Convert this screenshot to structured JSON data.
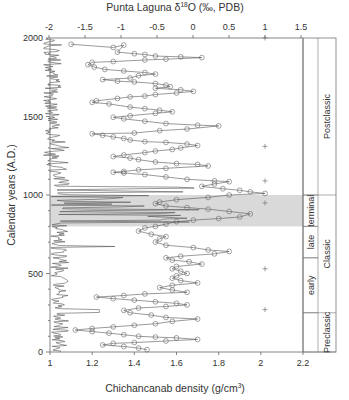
{
  "chart_data": {
    "type": "line",
    "title": "",
    "top_axis": {
      "label": "Punta Laguna δ18O (‰, PDB)",
      "label_main": "Punta Laguna δ",
      "label_sup": "18",
      "label_rest": "O (‰, PDB)",
      "range": [
        -2,
        1.5
      ],
      "ticks": [
        -2,
        -1.5,
        -1,
        -0.5,
        0,
        0.5,
        1,
        1.5
      ]
    },
    "bottom_axis": {
      "label": "Chichancanab density (g/cm3)",
      "label_main": "Chichancanab density (g/cm",
      "label_sup": "3",
      "label_rest": ")",
      "range": [
        1,
        2.2
      ],
      "ticks": [
        1,
        1.2,
        1.4,
        1.6,
        1.8,
        2,
        2.2
      ]
    },
    "ylabel": "Calendar years (A.D.)",
    "ylim": [
      0,
      2000
    ],
    "yticks": [
      0,
      500,
      1000,
      1500,
      2000
    ],
    "shaded_band": {
      "from": 800,
      "to": 1000,
      "color": "#d9d9d9"
    },
    "periods": {
      "sub": [
        {
          "label": "terminal",
          "from": 800,
          "to": 1000
        },
        {
          "label": "late",
          "from": 600,
          "to": 800
        },
        {
          "label": "early",
          "from": 250,
          "to": 600
        }
      ],
      "major": [
        {
          "label": "Postclassic",
          "from": 1000,
          "to": 2000
        },
        {
          "label": "Classic",
          "from": 250,
          "to": 1000
        },
        {
          "label": "Preclassic",
          "from": 0,
          "to": 250
        }
      ]
    },
    "series": [
      {
        "name": "Chichancanab density",
        "axis": "bottom",
        "line_color": "#444444",
        "points": [
          [
            1.1,
            1960
          ],
          [
            1.3,
            1940
          ],
          [
            1.35,
            1955
          ],
          [
            1.32,
            1910
          ],
          [
            1.4,
            1900
          ],
          [
            1.45,
            1895
          ],
          [
            1.5,
            1885
          ],
          [
            1.62,
            1880
          ],
          [
            1.72,
            1875
          ],
          [
            1.55,
            1865
          ],
          [
            1.45,
            1860
          ],
          [
            1.3,
            1850
          ],
          [
            1.2,
            1845
          ],
          [
            1.18,
            1830
          ],
          [
            1.21,
            1815
          ],
          [
            1.26,
            1800
          ],
          [
            1.35,
            1790
          ],
          [
            1.45,
            1780
          ],
          [
            1.5,
            1770
          ],
          [
            1.42,
            1760
          ],
          [
            1.38,
            1745
          ],
          [
            1.25,
            1735
          ],
          [
            1.32,
            1725
          ],
          [
            1.4,
            1720
          ],
          [
            1.5,
            1710
          ],
          [
            1.55,
            1700
          ],
          [
            1.57,
            1690
          ],
          [
            1.5,
            1680
          ],
          [
            1.62,
            1670
          ],
          [
            1.68,
            1660
          ],
          [
            1.6,
            1650
          ],
          [
            1.5,
            1640
          ],
          [
            1.45,
            1630
          ],
          [
            1.38,
            1625
          ],
          [
            1.32,
            1615
          ],
          [
            1.22,
            1600
          ],
          [
            1.2,
            1590
          ],
          [
            1.28,
            1580
          ],
          [
            1.38,
            1560
          ],
          [
            1.45,
            1550
          ],
          [
            1.52,
            1540
          ],
          [
            1.58,
            1530
          ],
          [
            1.5,
            1520
          ],
          [
            1.38,
            1505
          ],
          [
            1.3,
            1495
          ],
          [
            1.35,
            1485
          ],
          [
            1.45,
            1470
          ],
          [
            1.55,
            1455
          ],
          [
            1.7,
            1445
          ],
          [
            1.8,
            1440
          ],
          [
            1.65,
            1420
          ],
          [
            1.52,
            1410
          ],
          [
            1.4,
            1395
          ],
          [
            1.2,
            1390
          ],
          [
            1.25,
            1380
          ],
          [
            1.3,
            1370
          ],
          [
            1.35,
            1360
          ],
          [
            1.38,
            1350
          ],
          [
            1.45,
            1340
          ],
          [
            1.55,
            1335
          ],
          [
            1.65,
            1325
          ],
          [
            1.7,
            1315
          ],
          [
            1.62,
            1300
          ],
          [
            1.58,
            1290
          ],
          [
            1.5,
            1280
          ],
          [
            1.45,
            1270
          ],
          [
            1.35,
            1255
          ],
          [
            1.3,
            1245
          ],
          [
            1.38,
            1235
          ],
          [
            1.42,
            1225
          ],
          [
            1.5,
            1210
          ],
          [
            1.6,
            1200
          ],
          [
            1.7,
            1195
          ],
          [
            1.75,
            1185
          ],
          [
            1.55,
            1170
          ],
          [
            1.42,
            1160
          ],
          [
            1.35,
            1150
          ],
          [
            1.3,
            1145
          ],
          [
            1.35,
            1140
          ],
          [
            1.45,
            1130
          ],
          [
            1.55,
            1115
          ],
          [
            1.65,
            1100
          ],
          [
            1.78,
            1090
          ],
          [
            1.85,
            1085
          ],
          [
            1.78,
            1070
          ],
          [
            1.72,
            1055
          ],
          [
            1.82,
            1040
          ],
          [
            1.9,
            1030
          ],
          [
            1.95,
            1020
          ],
          [
            2.02,
            1010
          ],
          [
            1.85,
            1000
          ],
          [
            1.75,
            985
          ],
          [
            1.6,
            970
          ],
          [
            1.52,
            955
          ],
          [
            1.5,
            945
          ],
          [
            1.55,
            930
          ],
          [
            1.65,
            920
          ],
          [
            1.75,
            910
          ],
          [
            1.85,
            895
          ],
          [
            1.95,
            880
          ],
          [
            1.9,
            860
          ],
          [
            1.8,
            850
          ],
          [
            1.68,
            840
          ],
          [
            1.6,
            830
          ],
          [
            1.55,
            815
          ],
          [
            1.5,
            800
          ],
          [
            1.45,
            790
          ],
          [
            1.42,
            770
          ],
          [
            1.48,
            750
          ],
          [
            1.55,
            735
          ],
          [
            1.52,
            720
          ],
          [
            1.5,
            700
          ],
          [
            1.55,
            680
          ],
          [
            1.68,
            665
          ],
          [
            1.75,
            650
          ],
          [
            1.85,
            640
          ],
          [
            1.78,
            625
          ],
          [
            1.62,
            610
          ],
          [
            1.55,
            600
          ],
          [
            1.58,
            585
          ],
          [
            1.66,
            575
          ],
          [
            1.72,
            560
          ],
          [
            1.6,
            545
          ],
          [
            1.58,
            530
          ],
          [
            1.62,
            515
          ],
          [
            1.65,
            500
          ],
          [
            1.6,
            485
          ],
          [
            1.58,
            470
          ],
          [
            1.62,
            455
          ],
          [
            1.7,
            440
          ],
          [
            1.58,
            425
          ],
          [
            1.52,
            410
          ],
          [
            1.58,
            395
          ],
          [
            1.65,
            380
          ],
          [
            1.45,
            370
          ],
          [
            1.35,
            360
          ],
          [
            1.22,
            350
          ],
          [
            1.3,
            340
          ],
          [
            1.4,
            330
          ],
          [
            1.5,
            320
          ],
          [
            1.6,
            310
          ],
          [
            1.65,
            300
          ],
          [
            1.55,
            290
          ],
          [
            1.42,
            280
          ],
          [
            1.35,
            265
          ],
          [
            1.38,
            250
          ],
          [
            1.48,
            235
          ],
          [
            1.55,
            220
          ],
          [
            1.7,
            210
          ],
          [
            1.58,
            195
          ],
          [
            1.5,
            180
          ],
          [
            1.4,
            170
          ],
          [
            1.3,
            160
          ],
          [
            1.2,
            150
          ],
          [
            1.12,
            140
          ],
          [
            1.2,
            130
          ],
          [
            1.28,
            120
          ],
          [
            1.35,
            110
          ],
          [
            1.42,
            100
          ],
          [
            1.5,
            95
          ],
          [
            1.6,
            90
          ],
          [
            1.7,
            80
          ],
          [
            1.55,
            70
          ],
          [
            1.4,
            60
          ],
          [
            1.3,
            55
          ],
          [
            1.25,
            45
          ],
          [
            1.35,
            35
          ],
          [
            1.42,
            25
          ],
          [
            1.46,
            15
          ]
        ]
      },
      {
        "name": "Punta Laguna δ18O",
        "axis": "top",
        "line_color": "#555555",
        "description": "noisy trace near δ18O -2 to -1.5 with strong excursions toward positive values in 800-1000 and near 650-700"
      },
      {
        "name": "crosses",
        "axis": "top",
        "marker": "+",
        "points": [
          [
            1.0,
            2000
          ],
          [
            1.0,
            1310
          ],
          [
            1.0,
            1090
          ],
          [
            1.0,
            950
          ],
          [
            1.0,
            530
          ],
          [
            1.0,
            270
          ]
        ]
      }
    ]
  }
}
